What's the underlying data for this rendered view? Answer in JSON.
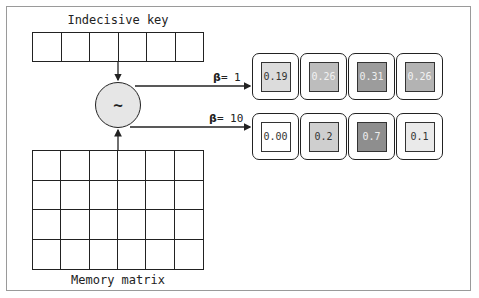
{
  "labels": {
    "key_title": "Indecisive key",
    "matrix_title": "Memory matrix",
    "similarity_symbol": "~"
  },
  "key": {
    "cells": 6
  },
  "matrix": {
    "rows": 4,
    "cols": 6
  },
  "branches": [
    {
      "beta_symbol": "β",
      "beta_label": "= 1",
      "outputs": [
        {
          "value": "0.19",
          "fill": "#dcdcdc",
          "text": "#333333"
        },
        {
          "value": "0.26",
          "fill": "#bdbdbd",
          "text": "#f2f2f2"
        },
        {
          "value": "0.31",
          "fill": "#9c9c9c",
          "text": "#eeeeee"
        },
        {
          "value": "0.26",
          "fill": "#b3b3b3",
          "text": "#f2f2f2"
        }
      ]
    },
    {
      "beta_symbol": "β",
      "beta_label": "= 10",
      "outputs": [
        {
          "value": "0.00",
          "fill": "#ffffff",
          "text": "#333333"
        },
        {
          "value": "0.2",
          "fill": "#cfcfcf",
          "text": "#333333"
        },
        {
          "value": "0.7",
          "fill": "#8e8e8e",
          "text": "#eeeeee"
        },
        {
          "value": "0.1",
          "fill": "#eaeaea",
          "text": "#333333"
        }
      ]
    }
  ]
}
